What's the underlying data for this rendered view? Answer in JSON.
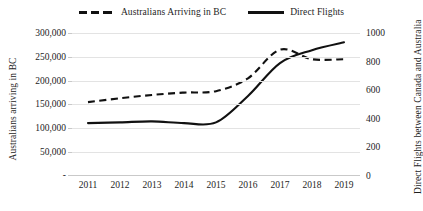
{
  "legend": {
    "position": "top-center",
    "items": [
      {
        "label": "Australians Arriving in BC",
        "style": "dashed",
        "marker": "dashed-line-icon",
        "color": "#111111"
      },
      {
        "label": "Direct Flights",
        "style": "solid",
        "marker": "solid-line-icon",
        "color": "#111111"
      }
    ]
  },
  "axes": {
    "y_left": {
      "title": "Australians arriving in BC",
      "ticks": [
        "300,000",
        "250,000",
        "200,000",
        "150,000",
        "100,000",
        "50,000",
        "-"
      ],
      "min": 0,
      "max": 300000,
      "step": 50000
    },
    "y_right": {
      "title": "Direct Flights between Canada and Australia",
      "ticks": [
        "1000",
        "800",
        "600",
        "400",
        "200",
        "0"
      ],
      "min": 0,
      "max": 1000,
      "step": 200
    },
    "x": {
      "title": "",
      "ticks": [
        "2011",
        "2012",
        "2013",
        "2014",
        "2015",
        "2016",
        "2017",
        "2018",
        "2019"
      ]
    }
  },
  "chart_data": {
    "type": "line",
    "title": "",
    "subtitle": "",
    "xlabel": "",
    "ylabel": "Australians arriving in BC",
    "y2label": "Direct Flights between Canada and Australia",
    "categories": [
      "2011",
      "2012",
      "2013",
      "2014",
      "2015",
      "2016",
      "2017",
      "2018",
      "2019"
    ],
    "x": [
      2011,
      2012,
      2013,
      2014,
      2015,
      2016,
      2017,
      2018,
      2019
    ],
    "ylim": [
      0,
      300000
    ],
    "y2lim": [
      0,
      1000
    ],
    "grid": true,
    "legend_position": "top-center",
    "series": [
      {
        "name": "Australians Arriving in BC",
        "axis": "left",
        "style": "dashed",
        "color": "#111111",
        "values": [
          155000,
          163000,
          170000,
          175000,
          178000,
          205000,
          265000,
          245000,
          245000
        ]
      },
      {
        "name": "Direct Flights",
        "axis": "right",
        "style": "solid",
        "color": "#111111",
        "values": [
          370,
          375,
          382,
          370,
          375,
          560,
          790,
          880,
          935
        ]
      }
    ]
  }
}
